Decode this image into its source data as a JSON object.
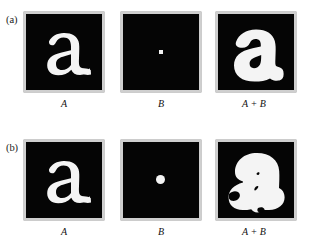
{
  "figure": {
    "type": "morphology-dilation-illustration",
    "background_color": "#ffffff",
    "panel_background_color": "#050505",
    "panel_frame_color": "#cfcfcf",
    "shape_color": "#f4f4f4",
    "rows": [
      {
        "label": "(a)",
        "panels": [
          {
            "caption": "A",
            "content": "letter-a",
            "description": "binary image of a bold lowercase letter a in white on black"
          },
          {
            "caption": "B",
            "content": "small-square-dot",
            "description": "small square structuring element at image center",
            "dot_size_px": 4,
            "dot_shape": "square"
          },
          {
            "caption": "A + B",
            "content": "letter-a-dilated-small",
            "description": "letter a dilated by the small square structuring element"
          }
        ]
      },
      {
        "label": "(b)",
        "panels": [
          {
            "caption": "A",
            "content": "letter-a",
            "description": "binary image of a bold lowercase letter a in white on black"
          },
          {
            "caption": "B",
            "content": "large-round-dot",
            "description": "larger round structuring element at image center",
            "dot_size_px": 9,
            "dot_shape": "circle"
          },
          {
            "caption": "A + B",
            "content": "letter-a-dilated-large",
            "description": "letter a dilated by the larger round structuring element, counters nearly closed"
          }
        ]
      }
    ]
  }
}
